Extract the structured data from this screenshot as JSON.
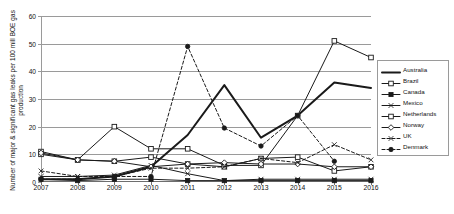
{
  "chart_data": {
    "type": "line",
    "title": "",
    "xlabel": "",
    "ylabel": "Number of major & significant gas leaks per 100 mill BOE gas production",
    "categories": [
      "2007",
      "2008",
      "2009",
      "2010",
      "2011",
      "2012",
      "2013",
      "2014",
      "2015",
      "2016"
    ],
    "x": [
      2007,
      2008,
      2009,
      2010,
      2011,
      2012,
      2013,
      2014,
      2015,
      2016
    ],
    "ylim": [
      0,
      60
    ],
    "yticks": [
      0,
      10,
      20,
      30,
      40,
      50,
      60
    ],
    "grid": true,
    "legend_position": "right",
    "series": [
      {
        "name": "Australia",
        "marker": "none",
        "style": "solid-thick",
        "values": [
          1,
          1,
          2,
          5.5,
          17,
          35,
          16,
          24,
          36,
          34
        ]
      },
      {
        "name": "Brazil",
        "marker": "open-square",
        "style": "solid",
        "values": [
          11,
          8,
          20,
          12,
          12,
          6,
          6,
          24,
          51,
          45
        ]
      },
      {
        "name": "Canada",
        "marker": "filled-square",
        "style": "solid",
        "values": [
          1,
          0.5,
          1,
          1,
          0.5,
          0.5,
          0.5,
          0.5,
          0.5,
          0.5
        ]
      },
      {
        "name": "Mexico",
        "marker": "cross",
        "style": "solid",
        "values": [
          2,
          2,
          2.5,
          6,
          3,
          0.5,
          1,
          1,
          1,
          1
        ]
      },
      {
        "name": "Netherlands",
        "marker": "open-square",
        "style": "solid",
        "values": [
          10,
          8,
          7.5,
          9,
          6.5,
          5.5,
          8.5,
          9,
          4,
          5.5
        ]
      },
      {
        "name": "Norway",
        "marker": "open-diamond",
        "style": "solid",
        "values": [
          10.5,
          8,
          7.5,
          5.5,
          6.5,
          7,
          6.5,
          6.5,
          5.5,
          5.5
        ]
      },
      {
        "name": "UK",
        "marker": "cross",
        "style": "dashed",
        "values": [
          4,
          2,
          2,
          5,
          5,
          5.5,
          8.5,
          7,
          13.5,
          8
        ]
      },
      {
        "name": "Denmark",
        "marker": "filled-circle",
        "style": "dashed",
        "values": [
          1,
          1,
          2,
          2,
          49,
          19.5,
          13,
          24,
          7.5,
          null
        ]
      }
    ]
  },
  "legend": {
    "items": [
      {
        "label": "Australia"
      },
      {
        "label": "Brazil"
      },
      {
        "label": "Canada"
      },
      {
        "label": "Mexico"
      },
      {
        "label": "Netherlands"
      },
      {
        "label": "Norway"
      },
      {
        "label": "UK"
      },
      {
        "label": "Denmark"
      }
    ]
  },
  "colors": {
    "line": "#1a1a1a",
    "grid": "#9a9a9a",
    "axis": "#6e6e6e",
    "background": "#ffffff"
  }
}
